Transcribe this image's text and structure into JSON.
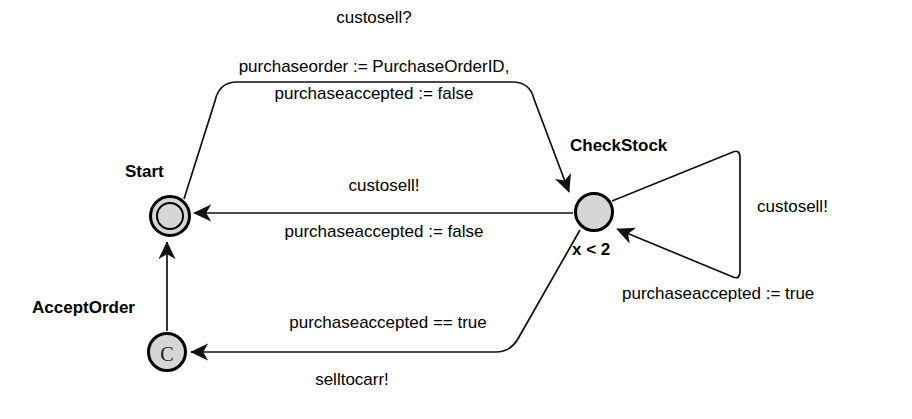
{
  "diagram": {
    "stroke_color": "#111111",
    "node_fill": "#d6d6d6",
    "background": "#ffffff"
  },
  "states": [
    {
      "id": "start",
      "label": "Start",
      "kind": "initial",
      "shape": "double-circle",
      "cx": 170,
      "cy": 216,
      "r": 21,
      "label_x": 125,
      "label_y": 164
    },
    {
      "id": "checkstock",
      "label": "CheckStock",
      "kind": "normal",
      "shape": "circle",
      "invariant": "x < 2",
      "cx": 594,
      "cy": 212,
      "r": 20,
      "label_x": 573,
      "label_y": 138,
      "invariant_x": 573,
      "invariant_y": 241
    },
    {
      "id": "acceptorder",
      "label": "AcceptOrder",
      "kind": "committed",
      "shape": "circle",
      "glyph": "C",
      "cx": 167,
      "cy": 352,
      "r": 20,
      "label_x": 32,
      "label_y": 300
    }
  ],
  "transitions": [
    {
      "id": "start-to-checkstock",
      "from": "Start",
      "to": "CheckStock",
      "sync": "custosell?",
      "assignments": [
        "purchaseorder := PurchaseOrderID,",
        "purchaseaccepted := false"
      ]
    },
    {
      "id": "checkstock-to-start",
      "from": "CheckStock",
      "to": "Start",
      "sync": "custosell!",
      "assignments": [
        "purchaseaccepted := false"
      ]
    },
    {
      "id": "checkstock-self-loop",
      "from": "CheckStock",
      "to": "CheckStock",
      "sync": "custosell!",
      "assignments": [
        "purchaseaccepted := true"
      ]
    },
    {
      "id": "checkstock-to-acceptorder",
      "from": "CheckStock",
      "to": "AcceptOrder",
      "guard": "purchaseaccepted == true",
      "sync": "selltocarr!"
    },
    {
      "id": "acceptorder-to-start",
      "from": "AcceptOrder",
      "to": "Start",
      "sync": "",
      "assignments": []
    }
  ],
  "labels": {
    "top_sync": "custosell?",
    "top_assign_line1": "purchaseorder := PurchaseOrderID,",
    "top_assign_line2": "purchaseaccepted := false",
    "middle_sync": "custosell!",
    "middle_assign": "purchaseaccepted := false",
    "loop_sync": "custosell!",
    "loop_assign": "purchaseaccepted := true",
    "bottom_guard": "purchaseaccepted == true",
    "bottom_sync": "selltocarr!",
    "state_start": "Start",
    "state_checkstock": "CheckStock",
    "state_acceptorder": "AcceptOrder",
    "invariant_checkstock": "x < 2",
    "committed_marker": "C"
  }
}
